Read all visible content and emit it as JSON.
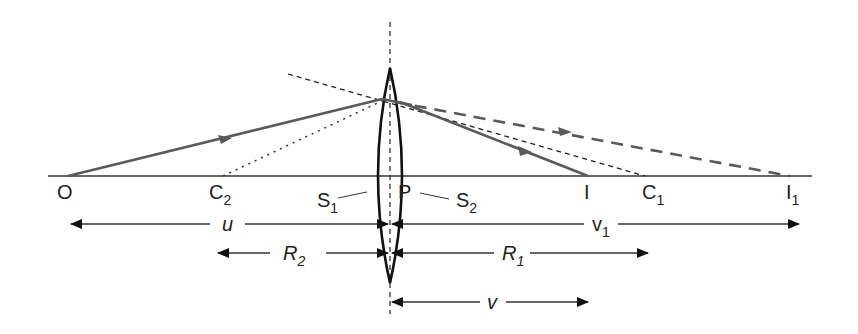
{
  "diagram": {
    "colors": {
      "ink": "#111111",
      "ray": "#5a5a5a",
      "background": "#ffffff"
    },
    "points": {
      "O": {
        "label": "O",
        "x": 68
      },
      "C2": {
        "label": "C",
        "sub": "2",
        "x": 223
      },
      "P": {
        "label": "P",
        "x": 397
      },
      "I": {
        "label": "I",
        "x": 588
      },
      "C1": {
        "label": "C",
        "sub": "1",
        "x": 645
      },
      "I1": {
        "label": "I",
        "sub": "1",
        "x": 790
      }
    },
    "surfaces": {
      "S1": {
        "label": "S",
        "sub": "1"
      },
      "S2": {
        "label": "S",
        "sub": "2"
      }
    },
    "distances": {
      "u": {
        "label": "u"
      },
      "v1": {
        "label": "v",
        "sub": "1"
      },
      "R2": {
        "label": "R",
        "sub": "2"
      },
      "R1": {
        "label": "R",
        "sub": "1"
      },
      "v": {
        "label": "v"
      }
    }
  }
}
